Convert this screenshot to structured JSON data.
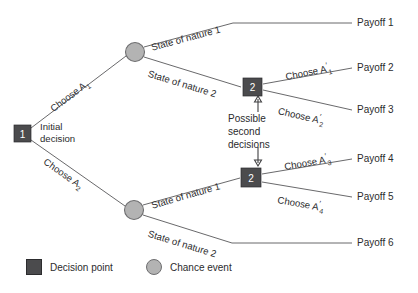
{
  "diagram": {
    "colors": {
      "decision_node": "#4b4b4d",
      "chance_node": "#b3b3b3",
      "edge": "#58585a",
      "text": "#2b2b2d",
      "background": "#ffffff"
    }
  },
  "nodes": {
    "root_decision": {
      "number": "1",
      "label": "Initial\ndecision",
      "label_line1": "Initial",
      "label_line2": "decision"
    },
    "upper_chance": {
      "kind": "chance-event"
    },
    "lower_chance": {
      "kind": "chance-event"
    },
    "upper_second_decision": {
      "number": "2"
    },
    "lower_second_decision": {
      "number": "2"
    }
  },
  "branches": {
    "choose_a1": {
      "text": "Choose A",
      "sub": "1",
      "prime": false
    },
    "choose_a2": {
      "text": "Choose A",
      "sub": "2",
      "prime": false
    },
    "state_nature_1_upper": {
      "text": "State of nature 1"
    },
    "state_nature_2_upper": {
      "text": "State of nature 2"
    },
    "state_nature_1_lower": {
      "text": "State of nature 1"
    },
    "state_nature_2_lower": {
      "text": "State of nature 2"
    },
    "choose_a1_prime": {
      "text": "Choose A",
      "sub": "1",
      "prime": true
    },
    "choose_a2_prime": {
      "text": "Choose A",
      "sub": "2",
      "prime": true
    },
    "choose_a3_prime": {
      "text": "Choose A",
      "sub": "3",
      "prime": true
    },
    "choose_a4_prime": {
      "text": "Choose A",
      "sub": "4",
      "prime": true
    }
  },
  "payoffs": [
    {
      "label": "Payoff 1"
    },
    {
      "label": "Payoff 2"
    },
    {
      "label": "Payoff 3"
    },
    {
      "label": "Payoff 4"
    },
    {
      "label": "Payoff 5"
    },
    {
      "label": "Payoff 6"
    }
  ],
  "annotation": {
    "line1": "Possible",
    "line2": "second",
    "line3": "decisions"
  },
  "legend": {
    "decision_point": "Decision point",
    "chance_event": "Chance event"
  }
}
